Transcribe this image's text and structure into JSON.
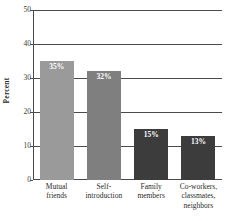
{
  "chart_data": {
    "type": "bar",
    "title": "",
    "xlabel": "",
    "ylabel": "Percent",
    "ylim": [
      0,
      50
    ],
    "yticks": [
      0,
      10,
      20,
      30,
      40,
      50
    ],
    "ytick_labels": [
      "0",
      "10",
      "20",
      "30",
      "40",
      "50"
    ],
    "grid": true,
    "legend": "none",
    "categories": [
      "Mutual friends",
      "Self-introduction",
      "Family members",
      "Co-workers, classmates, neighbors"
    ],
    "values": [
      35,
      32,
      15,
      13
    ],
    "data_labels": [
      "35%",
      "32%",
      "15%",
      "13%"
    ],
    "bar_colors": [
      "#9a9a9a",
      "#7f7f7f",
      "#3c3c3c",
      "#3c3c3c"
    ],
    "axis_color": "#4a4a4a",
    "data_label_color": "#ffffff",
    "category_label_lines": [
      [
        "Mutual",
        "friends"
      ],
      [
        "Self-",
        "introduction"
      ],
      [
        "Family",
        "members"
      ],
      [
        "Co-workers,",
        "classmates,",
        "neighbors"
      ]
    ]
  }
}
